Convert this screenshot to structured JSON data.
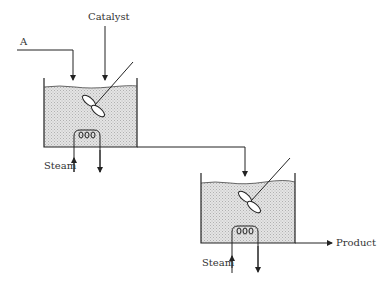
{
  "diagram": {
    "type": "process-flow",
    "labels": {
      "feed_a": "A",
      "catalyst": "Catalyst",
      "steam_1": "Steam",
      "steam_2": "Steam",
      "product": "Product"
    },
    "colors": {
      "line": "#222222",
      "liquid": "#d9d9d9",
      "background": "#ffffff"
    },
    "units": [
      {
        "id": "reactor-1",
        "kind": "stirred-tank",
        "inputs": [
          "A",
          "Catalyst"
        ],
        "heating": "Steam",
        "output": "reactor-2"
      },
      {
        "id": "reactor-2",
        "kind": "stirred-tank",
        "inputs": [
          "reactor-1"
        ],
        "heating": "Steam",
        "output": "Product"
      }
    ]
  }
}
